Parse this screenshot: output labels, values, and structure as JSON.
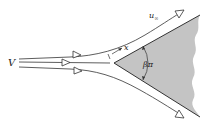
{
  "diagram": {
    "type": "wedge-flow",
    "labels": {
      "freestream_velocity": "V",
      "edge_velocity": "u",
      "edge_velocity_subscript": "∞",
      "coordinate": "x",
      "wedge_angle": "βπ"
    },
    "colors": {
      "wedge_fill": "#c4c4c4",
      "stroke": "#333333",
      "background": "#ffffff"
    },
    "geometry": {
      "apex": [
        114,
        63
      ],
      "upper_edge_end": [
        200,
        15
      ],
      "lower_edge_end": [
        200,
        117
      ]
    }
  }
}
